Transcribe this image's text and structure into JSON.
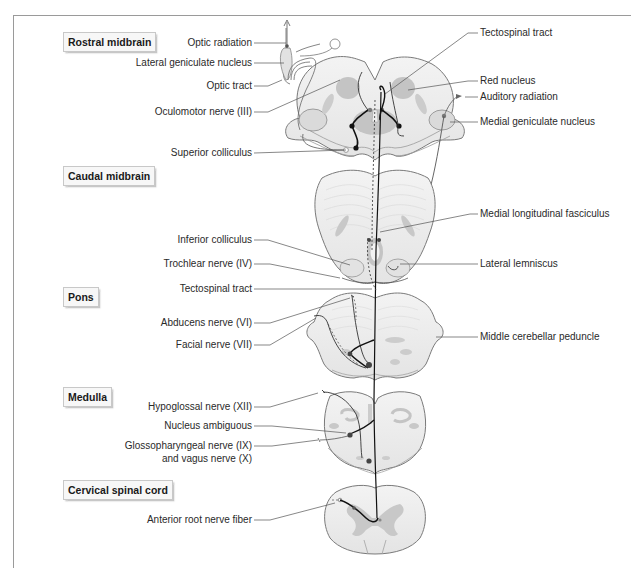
{
  "figure": {
    "sections": [
      {
        "id": "rostral-midbrain",
        "label": "Rostral midbrain"
      },
      {
        "id": "caudal-midbrain",
        "label": "Caudal midbrain"
      },
      {
        "id": "pons",
        "label": "Pons"
      },
      {
        "id": "medulla",
        "label": "Medulla"
      },
      {
        "id": "cervical-spinal-cord",
        "label": "Cervical spinal cord"
      }
    ],
    "left_labels": [
      {
        "id": "optic-radiation",
        "text": "Optic radiation"
      },
      {
        "id": "lateral-geniculate-nucleus",
        "text": "Lateral geniculate nucleus"
      },
      {
        "id": "optic-tract",
        "text": "Optic tract"
      },
      {
        "id": "oculomotor-nerve",
        "text": "Oculomotor nerve (III)"
      },
      {
        "id": "superior-colliculus",
        "text": "Superior colliculus"
      },
      {
        "id": "inferior-colliculus",
        "text": "Inferior colliculus"
      },
      {
        "id": "trochlear-nerve",
        "text": "Trochlear nerve (IV)"
      },
      {
        "id": "tectospinal-tract-left",
        "text": "Tectospinal tract"
      },
      {
        "id": "abducens-nerve",
        "text": "Abducens nerve (VI)"
      },
      {
        "id": "facial-nerve",
        "text": "Facial nerve (VII)"
      },
      {
        "id": "hypoglossal-nerve",
        "text": "Hypoglossal nerve (XII)"
      },
      {
        "id": "nucleus-ambiguous",
        "text": "Nucleus ambiguous"
      },
      {
        "id": "glossopharyngeal-vagus-line1",
        "text": "Glossopharyngeal nerve (IX)"
      },
      {
        "id": "glossopharyngeal-vagus-line2",
        "text": "and vagus nerve (X)"
      },
      {
        "id": "anterior-root-nerve-fiber",
        "text": "Anterior root nerve fiber"
      }
    ],
    "right_labels": [
      {
        "id": "tectospinal-tract-right",
        "text": "Tectospinal tract"
      },
      {
        "id": "red-nucleus",
        "text": "Red nucleus"
      },
      {
        "id": "auditory-radiation",
        "text": "Auditory radiation"
      },
      {
        "id": "medial-geniculate-nucleus",
        "text": "Medial geniculate nucleus"
      },
      {
        "id": "medial-longitudinal-fasciculus",
        "text": "Medial longitudinal fasciculus"
      },
      {
        "id": "lateral-lemniscus",
        "text": "Lateral lemniscus"
      },
      {
        "id": "middle-cerebellar-peduncle",
        "text": "Middle cerebellar peduncle"
      }
    ],
    "colors": {
      "tissue_fill": "#ececec",
      "tissue_outline": "#7a7a7a",
      "nucleus_fill": "#c4c4c4",
      "pathway": "#111111",
      "leader_line": "#555555",
      "frame": "#9a9a9a"
    }
  }
}
